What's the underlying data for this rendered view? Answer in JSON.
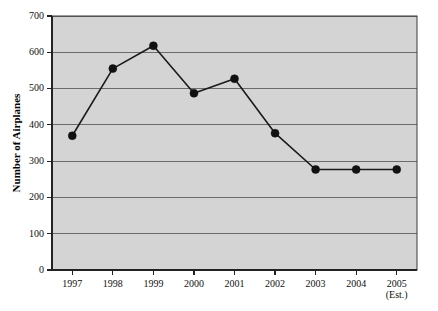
{
  "chart_data": {
    "type": "line",
    "title": "",
    "xlabel": "",
    "ylabel": "Number of Airplanes",
    "categories": [
      "1997",
      "1998",
      "1999",
      "2000",
      "2001",
      "2002",
      "2003",
      "2004",
      "2005"
    ],
    "category_sublabels": [
      "",
      "",
      "",
      "",
      "",
      "",
      "",
      "",
      "(Est.)"
    ],
    "values": [
      370,
      555,
      618,
      487,
      527,
      377,
      277,
      277,
      277
    ],
    "series": [
      {
        "name": "Number of Airplanes",
        "values": [
          370,
          555,
          618,
          487,
          527,
          377,
          277,
          277,
          277
        ]
      }
    ],
    "ylim": [
      0,
      700
    ],
    "ytick_labels": [
      "0",
      "100",
      "200",
      "300",
      "400",
      "500",
      "600",
      "700"
    ],
    "ytick_values": [
      0,
      100,
      200,
      300,
      400,
      500,
      600,
      700
    ],
    "grid": true,
    "legend": "none",
    "marker": "filled-circle",
    "plot_background_color": "#d4d4d4",
    "line_color": "#1a1a1a",
    "gridline_color": "#6b6b6b",
    "axis_color": "#222222"
  }
}
